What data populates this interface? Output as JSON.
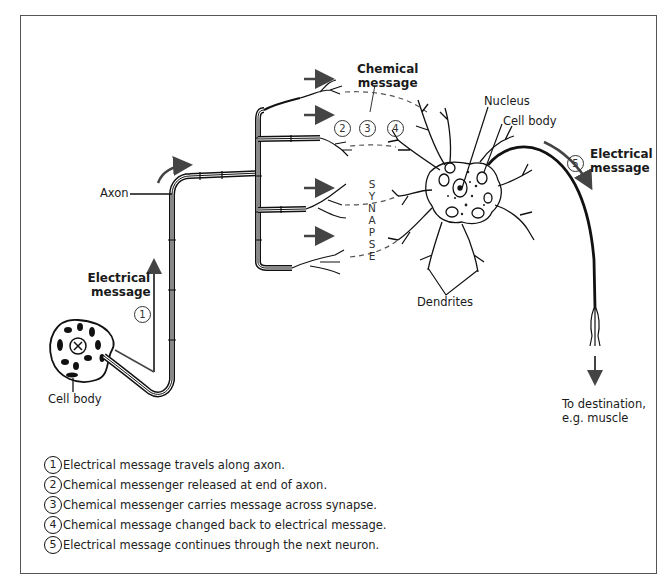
{
  "diagram": {
    "labels": {
      "axon": "Axon",
      "electrical_message_left": [
        "Electrical",
        "message"
      ],
      "cell_body_left": "Cell body",
      "chemical_message": [
        "Chemical",
        "message"
      ],
      "nucleus": "Nucleus",
      "cell_body_right": "Cell body",
      "electrical_message_right": [
        "Electrical",
        "message"
      ],
      "dendrites": "Dendrites",
      "destination": [
        "To destination,",
        "e.g. muscle"
      ],
      "synapse_letters": [
        "S",
        "Y",
        "N",
        "A",
        "P",
        "S",
        "E"
      ]
    },
    "step_markers": {
      "one": "1",
      "two": "2",
      "three": "3",
      "four": "4",
      "five": "5"
    }
  },
  "legend": {
    "items": [
      {
        "num": "1",
        "text": "Electrical message travels along axon."
      },
      {
        "num": "2",
        "text": "Chemical messenger released at end of axon."
      },
      {
        "num": "3",
        "text": "Chemical messenger carries message across synapse."
      },
      {
        "num": "4",
        "text": "Chemical message changed back to electrical message."
      },
      {
        "num": "5",
        "text": "Electrical message continues through the next neuron."
      }
    ]
  }
}
